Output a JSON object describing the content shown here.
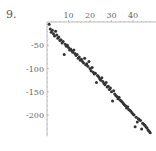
{
  "label": "9.",
  "chart_data": {
    "type": "scatter",
    "title": "",
    "xlabel": "",
    "ylabel": "",
    "xlim": [
      0,
      50
    ],
    "ylim": [
      -250,
      0
    ],
    "x_ticks": [
      10,
      20,
      30,
      40
    ],
    "y_ticks": [
      -50,
      -100,
      -150,
      -200
    ],
    "grid": false,
    "legend": null,
    "trend": "approximately linear, y ≈ -5x with noise",
    "series": [
      {
        "name": "data",
        "x": [
          1,
          1.5,
          2,
          2.5,
          3,
          3.5,
          4,
          4.5,
          5,
          5.5,
          6,
          6.5,
          7,
          7.5,
          8,
          8.5,
          9,
          9.5,
          10,
          10.5,
          11,
          11.5,
          12,
          12.5,
          13,
          13.5,
          14,
          14.5,
          15,
          15.5,
          16,
          16.5,
          17,
          17.5,
          18,
          18.5,
          19,
          19.5,
          20,
          20.5,
          21,
          21.5,
          22,
          22.5,
          23,
          23.5,
          24,
          24.5,
          25,
          25.5,
          26,
          26.5,
          27,
          27.5,
          28,
          28.5,
          29,
          29.5,
          30,
          30.5,
          31,
          31.5,
          32,
          32.5,
          33,
          33.5,
          34,
          34.5,
          35,
          35.5,
          36,
          36.5,
          37,
          37.5,
          38,
          38.5,
          39,
          39.5,
          40,
          40.5,
          41,
          41.5,
          42,
          42.5,
          43,
          43.5,
          44,
          44.5,
          45,
          45.5,
          46,
          46.5,
          47,
          47.5,
          48
        ],
        "y": [
          -5,
          -15,
          -22,
          -18,
          -25,
          -30,
          -20,
          -28,
          -35,
          -32,
          -40,
          -38,
          -45,
          -42,
          -70,
          -48,
          -52,
          -50,
          -55,
          -60,
          -58,
          -62,
          -65,
          -60,
          -68,
          -72,
          -70,
          -78,
          -75,
          -82,
          -80,
          -85,
          -88,
          -78,
          -92,
          -90,
          -95,
          -85,
          -100,
          -105,
          -98,
          -108,
          -112,
          -110,
          -130,
          -115,
          -118,
          -122,
          -125,
          -120,
          -128,
          -132,
          -135,
          -130,
          -140,
          -138,
          -145,
          -142,
          -150,
          -170,
          -148,
          -155,
          -158,
          -160,
          -165,
          -162,
          -168,
          -170,
          -172,
          -175,
          -178,
          -180,
          -185,
          -182,
          -188,
          -190,
          -192,
          -195,
          -198,
          -200,
          -225,
          -205,
          -215,
          -208,
          -210,
          -212,
          -230,
          -218,
          -220,
          -222,
          -225,
          -228,
          -232,
          -235,
          -238
        ]
      }
    ]
  }
}
